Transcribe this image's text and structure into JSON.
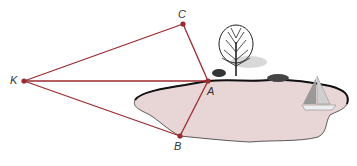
{
  "diagram": {
    "type": "geometry-survey",
    "colors": {
      "line": "#9c2a2e",
      "point": "#9c2a2e",
      "lake_fill": "#e8d6d6",
      "shore": "#111111",
      "label": "#333333"
    },
    "points": [
      {
        "id": "K",
        "label": "K",
        "x": 24,
        "y": 81
      },
      {
        "id": "C",
        "label": "C",
        "x": 183,
        "y": 24
      },
      {
        "id": "A",
        "label": "A",
        "x": 208,
        "y": 81
      },
      {
        "id": "B",
        "label": "B",
        "x": 180,
        "y": 136
      }
    ],
    "segments": [
      {
        "from": "K",
        "to": "C"
      },
      {
        "from": "K",
        "to": "A"
      },
      {
        "from": "K",
        "to": "B"
      },
      {
        "from": "C",
        "to": "A"
      },
      {
        "from": "A",
        "to": "B"
      }
    ],
    "scene_objects": [
      "lake",
      "tree",
      "bushes",
      "sailboat"
    ]
  },
  "labels": {
    "K": "K",
    "C": "C",
    "A": "A",
    "B": "B"
  }
}
